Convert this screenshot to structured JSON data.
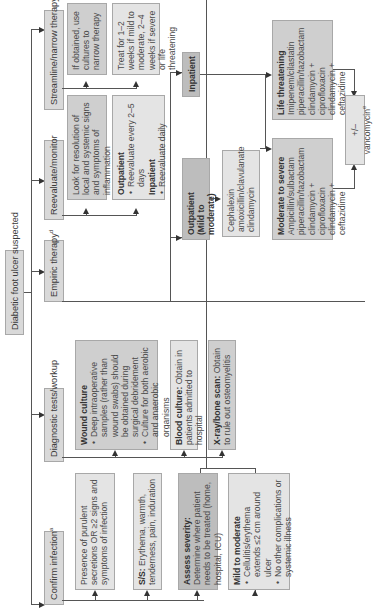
{
  "root": {
    "label": "Diabetic foot ulcer suspected"
  },
  "columns": {
    "confirm": {
      "label": "Confirm infection",
      "sup": "a"
    },
    "diagnostic": {
      "label": "Diagnostic tests/workup"
    },
    "empiric": {
      "label": "Empiric therapy",
      "sup": "d"
    },
    "reevaluate": {
      "label": "Reevaluate/monitor"
    },
    "streamline": {
      "label": "Streamline/narrow therapy"
    }
  },
  "confirm_boxes": {
    "purulent": {
      "text": "Presence of purulent secretions OR ≥2 signs and symptoms of infection"
    },
    "ss": {
      "title": "S/S:",
      "text": " Erythema, warmth, tenderness, pain, induration"
    },
    "severity": {
      "title": "Assess severity:",
      "text": " Determine where patient needs to be treated (home, hospital, ICU)"
    },
    "mild": {
      "title": "Mild to moderate",
      "bullets": [
        "Cellulitis/erythema extends ≤2 cm around ulcer",
        "No other complications or systemic illness"
      ]
    }
  },
  "diagnostic_boxes": {
    "wound": {
      "title": "Wound culture",
      "bullets": [
        "Deep intraoperative samples (rather than wound swabs) should be obtained during surgical debridement",
        "Culture for both aerobic and anaerobic organisms"
      ]
    },
    "blood": {
      "title": "Blood culture:",
      "text": " Obtain in patients admitted to hospital"
    },
    "xray": {
      "title": "X-ray/bone scan:",
      "text": " Obtain to rule out osteomyelitis"
    }
  },
  "empiric_boxes": {
    "outpatient": {
      "title": "Outpatient",
      "subtitle": "(Mild to moderate)"
    },
    "outpatient_drugs": {
      "lines": [
        "Cephalexin",
        "amoxicillin/clavulanate",
        "clindamycin"
      ]
    },
    "inpatient": {
      "title": "Inpatient"
    },
    "moderate": {
      "title": "Moderate to severe",
      "lines": [
        "Ampicillin/sulbactam",
        "piperacillin/tazobactam",
        "clindamycin + ciprofloxacin",
        "clindamycin + ceftazidime"
      ]
    },
    "life": {
      "title": "Life threatening",
      "lines": [
        "Imipenem/cilastatin",
        "piperacillin/tazobactam",
        "clindamycin + ciprofloxacin",
        "clindamycin + ceftazidime"
      ]
    },
    "vanco": {
      "label": "+/– vancomycin",
      "sup": "e"
    }
  },
  "reevaluate_boxes": {
    "look": {
      "text": "Look for resolution of local and systemic signs and symptoms of inflammation"
    },
    "settings": {
      "outpatient_title": "Outpatient",
      "outpatient_bullet": "Reevaluate every 2–5 days",
      "inpatient_title": "Inpatient",
      "inpatient_bullet": "Reevaluate daily"
    }
  },
  "streamline_boxes": {
    "cultures": {
      "text": "If obtained, use cultures to narrow therapy"
    },
    "duration": {
      "text": "Treat for 1–2 weeks if mild to moderate, 2–4 weeks if severe or life threatening"
    }
  },
  "colors": {
    "light_fill": "#e4e4e4",
    "mid_fill": "#cfcfcf",
    "dark_fill": "#bdbdbd",
    "line": "#555555"
  }
}
